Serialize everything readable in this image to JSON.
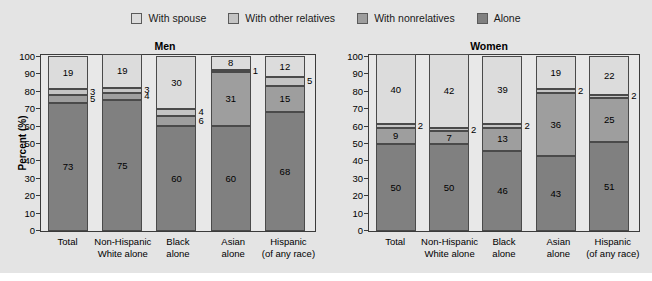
{
  "legend": {
    "items": [
      {
        "label": "With spouse",
        "color": "#dcdcdc",
        "icon": "legend-swatch-icon"
      },
      {
        "label": "With other relatives",
        "color": "#c4c4c4",
        "icon": "legend-swatch-icon"
      },
      {
        "label": "With nonrelatives",
        "color": "#9e9e9e",
        "icon": "legend-swatch-icon"
      },
      {
        "label": "Alone",
        "color": "#808080",
        "icon": "legend-swatch-icon"
      }
    ]
  },
  "axis": {
    "ylabel": "Percent (%)",
    "yticks": [
      "100",
      "90",
      "80",
      "70",
      "60",
      "50",
      "40",
      "30",
      "20",
      "10",
      "0"
    ],
    "ymin": 0,
    "ymax": 100
  },
  "panels": [
    {
      "key": "men",
      "title": "Men"
    },
    {
      "key": "women",
      "title": "Women"
    }
  ],
  "chart_data": {
    "type": "bar",
    "subtype": "stacked-bar-100",
    "title": "",
    "xlabel": "",
    "ylabel": "Percent (%)",
    "ylim": [
      0,
      100
    ],
    "ytick_step": 10,
    "grid": false,
    "legend_position": "top-center",
    "panels": [
      "Men",
      "Women"
    ],
    "categories": [
      "Total",
      "Non-Hispanic White alone",
      "Black alone",
      "Asian alone",
      "Hispanic (of any race)"
    ],
    "series_order": [
      "Alone",
      "With nonrelatives",
      "With other relatives",
      "With spouse"
    ],
    "colors": {
      "Alone": "#808080",
      "With nonrelatives": "#9e9e9e",
      "With other relatives": "#c4c4c4",
      "With spouse": "#dcdcdc"
    },
    "Men": {
      "Alone": [
        73,
        75,
        60,
        60,
        68
      ],
      "With nonrelatives": [
        5,
        4,
        6,
        31,
        15
      ],
      "With other relatives": [
        3,
        3,
        4,
        1,
        5
      ],
      "With spouse": [
        19,
        19,
        30,
        8,
        12
      ]
    },
    "Women": {
      "Alone": [
        50,
        50,
        46,
        43,
        51
      ],
      "With nonrelatives": [
        9,
        7,
        13,
        36,
        25
      ],
      "With other relatives": [
        2,
        2,
        2,
        2,
        2
      ],
      "With spouse": [
        40,
        42,
        39,
        19,
        22
      ]
    }
  },
  "xlabels": [
    {
      "line1": "Total",
      "line2": ""
    },
    {
      "line1": "Non-Hispanic",
      "line2": "White alone"
    },
    {
      "line1": "Black",
      "line2": "alone"
    },
    {
      "line1": "Asian",
      "line2": "alone"
    },
    {
      "line1": "Hispanic",
      "line2": "(of any race)"
    }
  ],
  "caption": {
    "text": ""
  }
}
